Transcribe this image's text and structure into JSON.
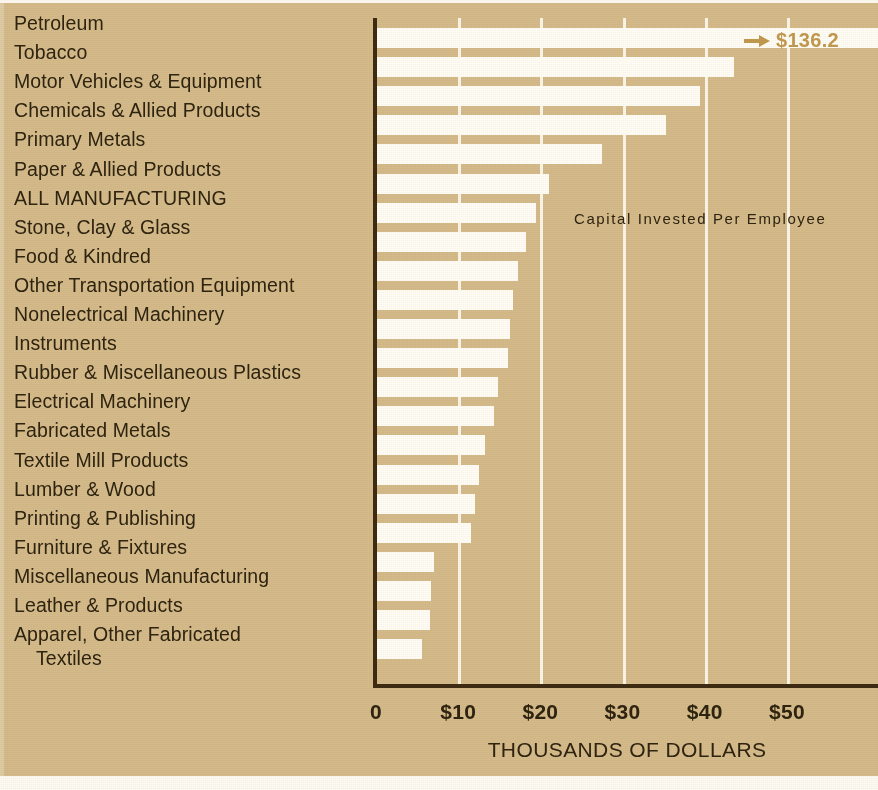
{
  "title": "CAPITAL INVESTED PER EMPLOYEE IN MANUFACTURING",
  "annotation": "Capital  Invested  Per  Employee",
  "peak_callout": "$136.2",
  "xaxis_title": "THOUSANDS OF DOLLARS",
  "colors": {
    "background": "#d5bb8b",
    "bar": "#fffdf6",
    "gridline": "#fbf6e9",
    "axis": "#3d2b12",
    "text": "#2e2410",
    "callout": "#c19a4e"
  },
  "chart_data": {
    "type": "bar",
    "orientation": "horizontal",
    "title": "CAPITAL INVESTED PER EMPLOYEE IN MANUFACTURING",
    "xlabel": "THOUSANDS OF DOLLARS",
    "ylabel": "",
    "xlim": [
      0,
      61
    ],
    "xticks": [
      0,
      10,
      20,
      30,
      40,
      50
    ],
    "xtick_labels": [
      "0",
      "$10",
      "$20",
      "$30",
      "$40",
      "$50"
    ],
    "grid": true,
    "legend": false,
    "annotations": [
      "Capital  Invested  Per  Employee",
      "$136.2"
    ],
    "categories": [
      "Petroleum",
      "Tobacco",
      "Motor Vehicles & Equipment",
      "Chemicals & Allied Products",
      "Primary Metals",
      "Paper & Allied Products",
      "ALL MANUFACTURING",
      "Stone, Clay & Glass",
      "Food & Kindred",
      "Other Transportation Equipment",
      "Nonelectrical Machinery",
      "Instruments",
      "Rubber & Miscellaneous Plastics",
      "Electrical Machinery",
      "Fabricated Metals",
      "Textile Mill Products",
      "Lumber & Wood",
      "Printing & Publishing",
      "Furniture & Fixtures",
      "Miscellaneous Manufacturing",
      "Leather & Products",
      "Apparel, Other Fabricated Textiles"
    ],
    "values": [
      136.2,
      43.5,
      39.4,
      35.3,
      27.5,
      21.0,
      19.5,
      18.2,
      17.3,
      16.7,
      16.3,
      16.0,
      14.8,
      14.4,
      13.2,
      12.5,
      12.1,
      11.6,
      7.1,
      6.7,
      6.6,
      5.6
    ]
  },
  "rows": [
    {
      "label": "Petroleum",
      "label2": "",
      "value": 136.2,
      "clipped": true,
      "caps": false
    },
    {
      "label": "Tobacco",
      "label2": "",
      "value": 43.5,
      "clipped": false,
      "caps": false
    },
    {
      "label": "Motor Vehicles & Equipment",
      "label2": "",
      "value": 39.4,
      "clipped": false,
      "caps": false
    },
    {
      "label": "Chemicals & Allied Products",
      "label2": "",
      "value": 35.3,
      "clipped": false,
      "caps": false
    },
    {
      "label": "Primary Metals",
      "label2": "",
      "value": 27.5,
      "clipped": false,
      "caps": false
    },
    {
      "label": "Paper & Allied Products",
      "label2": "",
      "value": 21.0,
      "clipped": false,
      "caps": false
    },
    {
      "label": "ALL MANUFACTURING",
      "label2": "",
      "value": 19.5,
      "clipped": false,
      "caps": true
    },
    {
      "label": "Stone, Clay & Glass",
      "label2": "",
      "value": 18.2,
      "clipped": false,
      "caps": false
    },
    {
      "label": "Food & Kindred",
      "label2": "",
      "value": 17.3,
      "clipped": false,
      "caps": false
    },
    {
      "label": "Other Transportation Equipment",
      "label2": "",
      "value": 16.7,
      "clipped": false,
      "caps": false
    },
    {
      "label": "Nonelectrical Machinery",
      "label2": "",
      "value": 16.3,
      "clipped": false,
      "caps": false
    },
    {
      "label": "Instruments",
      "label2": "",
      "value": 16.0,
      "clipped": false,
      "caps": false
    },
    {
      "label": "Rubber & Miscellaneous Plastics",
      "label2": "",
      "value": 14.8,
      "clipped": false,
      "caps": false
    },
    {
      "label": "Electrical Machinery",
      "label2": "",
      "value": 14.4,
      "clipped": false,
      "caps": false
    },
    {
      "label": "Fabricated Metals",
      "label2": "",
      "value": 13.2,
      "clipped": false,
      "caps": false
    },
    {
      "label": "Textile Mill Products",
      "label2": "",
      "value": 12.5,
      "clipped": false,
      "caps": false
    },
    {
      "label": "Lumber & Wood",
      "label2": "",
      "value": 12.1,
      "clipped": false,
      "caps": false
    },
    {
      "label": "Printing & Publishing",
      "label2": "",
      "value": 11.6,
      "clipped": false,
      "caps": false
    },
    {
      "label": "Furniture & Fixtures",
      "label2": "",
      "value": 7.1,
      "clipped": false,
      "caps": false
    },
    {
      "label": "Miscellaneous Manufacturing",
      "label2": "",
      "value": 6.7,
      "clipped": false,
      "caps": false
    },
    {
      "label": "Leather & Products",
      "label2": "",
      "value": 6.6,
      "clipped": false,
      "caps": false
    },
    {
      "label": "Apparel, Other Fabricated",
      "label2": "Textiles",
      "value": 5.6,
      "clipped": false,
      "caps": false
    }
  ],
  "xticks": [
    {
      "label": "0",
      "value": 0
    },
    {
      "label": "$10",
      "value": 10
    },
    {
      "label": "$20",
      "value": 20
    },
    {
      "label": "$30",
      "value": 30
    },
    {
      "label": "$40",
      "value": 40
    },
    {
      "label": "$50",
      "value": 50
    }
  ]
}
